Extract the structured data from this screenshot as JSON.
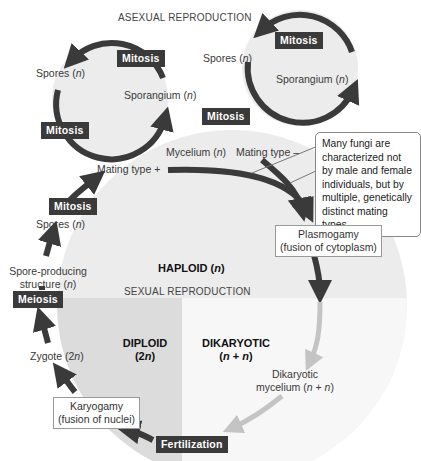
{
  "headers": {
    "asexual": "ASEXUAL REPRODUCTION",
    "sexual": "SEXUAL REPRODUCTION"
  },
  "regions": {
    "haploid": {
      "label": "HAPLOID",
      "ploidy": "(n)"
    },
    "diploid": {
      "label": "DIPLOID",
      "ploidy": "(2n)"
    },
    "dikaryotic": {
      "label": "DIKARYOTIC",
      "ploidy": "(n + n)"
    }
  },
  "asexual_left": {
    "spores": "Spores (n)",
    "sporangium": "Sporangium (n)",
    "mitosis_top": "Mitosis",
    "mitosis_bottom": "Mitosis"
  },
  "asexual_right": {
    "spores": "Spores (n)",
    "sporangium": "Sporangium (n)",
    "mitosis_top": "Mitosis",
    "mitosis_bottom": "Mitosis"
  },
  "labels": {
    "mycelium": "Mycelium (n)",
    "mating_plus": "Mating type +",
    "mating_minus": "Mating type –",
    "mitosis": "Mitosis",
    "spores": "Spores (n)",
    "spore_structure_1": "Spore-producing",
    "spore_structure_2": "structure (n)",
    "meiosis": "Meiosis",
    "zygote": "Zygote (2n)",
    "fertilization": "Fertilization",
    "dikaryotic_mycelium_1": "Dikaryotic",
    "dikaryotic_mycelium_2": "mycelium (n + n)"
  },
  "boxes": {
    "plasmogamy_1": "Plasmogamy",
    "plasmogamy_2": "(fusion of cytoplasm)",
    "karyogamy_1": "Karyogamy",
    "karyogamy_2": "(fusion of nuclei)"
  },
  "note": "Many fungi are characterized not by male and female individuals, but by multiple, genetically distinct mating types.",
  "colors": {
    "arrow_dark": "#3a3a3a",
    "arrow_light": "#c4c4c4",
    "haploid_fill": "#ececec",
    "diploid_fill": "#dcdcdc",
    "dikaryotic_fill": "#f6f6f6",
    "tag_bg": "#3a3a3a"
  }
}
